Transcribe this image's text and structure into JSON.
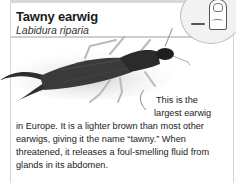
{
  "card": {
    "title": "Tawny earwig",
    "subtitle": "Labidura riparia"
  },
  "scale_inset": {
    "icon": "thumb-scale-icon"
  },
  "description": {
    "line1": "This is the",
    "line2": "largest earwig",
    "body": "in Europe. It is a lighter brown than most other earwigs, giving it the name “tawny.” When threatened, it releases a foul-smelling fluid from glands in its abdomen."
  }
}
